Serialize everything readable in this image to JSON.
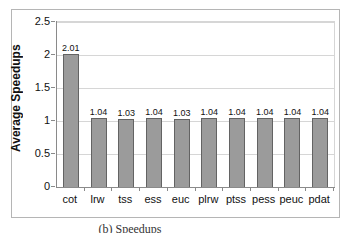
{
  "figure": {
    "caption": "(b) Speedups"
  },
  "chart_data": {
    "type": "bar",
    "title": "",
    "xlabel": "",
    "ylabel": "Average Speedups",
    "categories": [
      "cot",
      "lrw",
      "tss",
      "ess",
      "euc",
      "plrw",
      "ptss",
      "pess",
      "peuc",
      "pdat"
    ],
    "values": [
      2.01,
      1.04,
      1.03,
      1.04,
      1.03,
      1.04,
      1.04,
      1.04,
      1.04,
      1.04
    ],
    "data_labels": [
      "2.01",
      "1.04",
      "1.03",
      "1.04",
      "1.03",
      "1.04",
      "1.04",
      "1.04",
      "1.04",
      "1.04"
    ],
    "ylim": [
      0,
      2.5
    ],
    "yticks": [
      0,
      0.5,
      1,
      1.5,
      2,
      2.5
    ],
    "ytick_labels": [
      "0",
      "0.5",
      "1",
      "1.5",
      "2",
      "2.5"
    ],
    "grid": true,
    "legend": "none",
    "colors": {
      "bar_fill": "#9b9b9b",
      "bar_border": "#636363",
      "gridline": "#d6d6d6",
      "axis": "#8a8a8a",
      "frame_border": "#b5b5b5",
      "text": "#111111"
    }
  }
}
